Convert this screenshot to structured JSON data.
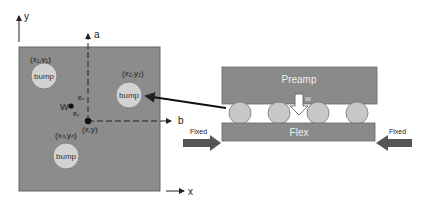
{
  "left_panel": {
    "axis_y_label": "y",
    "axis_x_label": "x",
    "axis_a_label": "a",
    "axis_b_label": "b",
    "bumps": [
      {
        "label": "bump",
        "coord": "(x₁,y₁)"
      },
      {
        "label": "bump",
        "coord": "(x₂,y₂)"
      },
      {
        "label": "bump",
        "coord": "(xₙ,yₙ)"
      }
    ],
    "weight_label": "W",
    "ex_label": "eₓ",
    "ey_label": "eᵧ",
    "center_label": "(x,y)"
  },
  "right_panel": {
    "top_block_label": "Preamp",
    "bottom_block_label": "Flex",
    "weight_label": "W",
    "left_fixed_label": "Fixed",
    "right_fixed_label": "Fixed"
  },
  "colors": {
    "plate": "#8c8c8c",
    "bump": "#d2d2d2",
    "block": "#8a8a8a",
    "arrow": "#555555"
  }
}
